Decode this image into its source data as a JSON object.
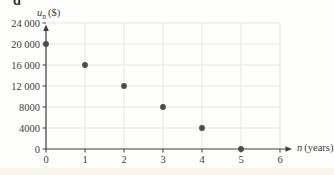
{
  "figure": {
    "part_label": "d"
  },
  "chart_data": {
    "type": "scatter",
    "title": "",
    "x": [
      0,
      1,
      2,
      3,
      4,
      5
    ],
    "y": [
      20000,
      16000,
      12000,
      8000,
      4000,
      0
    ],
    "points": [
      {
        "n": 0,
        "un": 20000
      },
      {
        "n": 1,
        "un": 16000
      },
      {
        "n": 2,
        "un": 12000
      },
      {
        "n": 3,
        "un": 8000
      },
      {
        "n": 4,
        "un": 4000
      },
      {
        "n": 5,
        "un": 0
      }
    ],
    "xlabel_var": "n",
    "xlabel_unit": "(years)",
    "ylabel_var": "u",
    "ylabel_sub": "n",
    "ylabel_unit": "($)",
    "xlim": [
      0,
      6
    ],
    "ylim": [
      0,
      24000
    ],
    "x_ticks": [
      0,
      1,
      2,
      3,
      4,
      5,
      6
    ],
    "y_ticks": [
      0,
      4000,
      8000,
      12000,
      16000,
      20000,
      24000
    ],
    "x_tick_labels": [
      "0",
      "1",
      "2",
      "3",
      "4",
      "5",
      "6"
    ],
    "y_tick_labels": [
      "0",
      "4000",
      "8000",
      "12 000",
      "16 000",
      "20 000",
      "24 000"
    ],
    "grid": true,
    "legend": "none",
    "colors": {
      "point": "#4c4c4c",
      "axis": "#3f3f3f",
      "grid": "#e7e7e7",
      "text": "#3f3f3f"
    },
    "marker_radius": 2.9
  }
}
